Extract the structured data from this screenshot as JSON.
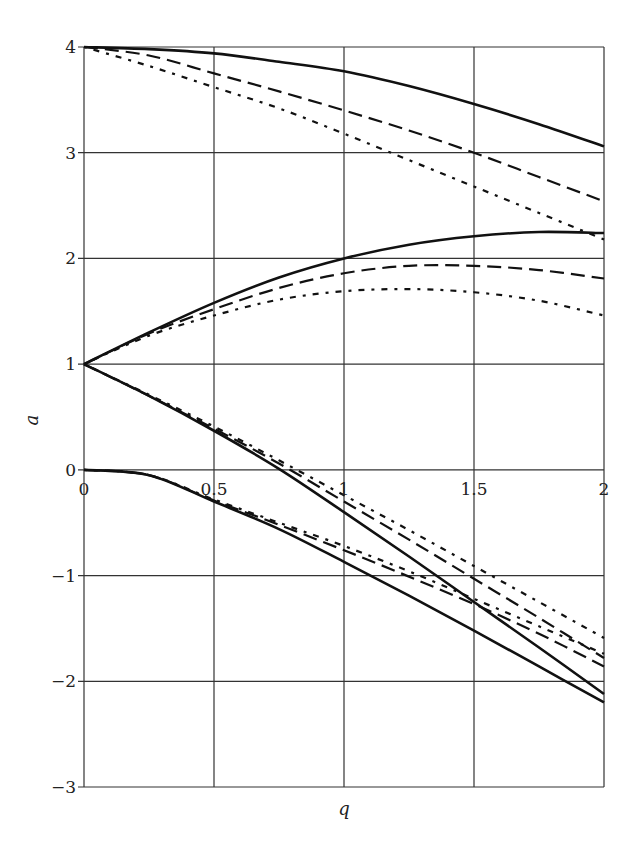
{
  "chart_data": {
    "type": "line",
    "title": "",
    "xlabel": "q",
    "ylabel": "a",
    "xlim": [
      0,
      2
    ],
    "ylim": [
      -3,
      4
    ],
    "grid": true,
    "legend": "none",
    "x_ticks": [
      0,
      0.5,
      1,
      1.5,
      2
    ],
    "x_tick_labels": [
      "0",
      "0.5",
      "1",
      "1.5",
      "2"
    ],
    "y_ticks": [
      4,
      3,
      2,
      1,
      0,
      -1,
      -2,
      -3
    ],
    "y_tick_labels": [
      "4",
      "3",
      "2",
      "1",
      "0",
      "−1",
      "−2",
      "−3"
    ],
    "x": [
      0,
      0.25,
      0.5,
      0.75,
      1.0,
      1.25,
      1.5,
      1.75,
      2.0
    ],
    "series": [
      {
        "name": "branch-4-solid",
        "style": "solid",
        "values": [
          4.0,
          3.98,
          3.94,
          3.86,
          3.77,
          3.63,
          3.46,
          3.27,
          3.06
        ]
      },
      {
        "name": "branch-4-dashed",
        "style": "dashed",
        "values": [
          4.0,
          3.92,
          3.75,
          3.58,
          3.4,
          3.21,
          3.0,
          2.77,
          2.54
        ]
      },
      {
        "name": "branch-4-dashdot",
        "style": "dashdot",
        "values": [
          4.0,
          3.82,
          3.62,
          3.42,
          3.18,
          2.93,
          2.68,
          2.43,
          2.18
        ]
      },
      {
        "name": "branch-1-upper-solid",
        "style": "solid",
        "values": [
          1.0,
          1.3,
          1.58,
          1.82,
          2.0,
          2.13,
          2.21,
          2.25,
          2.24
        ]
      },
      {
        "name": "branch-1-upper-dashed",
        "style": "dashed",
        "values": [
          1.0,
          1.29,
          1.52,
          1.72,
          1.86,
          1.93,
          1.93,
          1.89,
          1.81
        ]
      },
      {
        "name": "branch-1-upper-dashdot",
        "style": "dashdot",
        "values": [
          1.0,
          1.27,
          1.46,
          1.61,
          1.69,
          1.71,
          1.68,
          1.6,
          1.46
        ]
      },
      {
        "name": "branch-1-lower-solid",
        "style": "solid",
        "values": [
          1.0,
          0.7,
          0.37,
          0.01,
          -0.4,
          -0.82,
          -1.25,
          -1.68,
          -2.12
        ]
      },
      {
        "name": "branch-1-lower-dashed",
        "style": "dashed",
        "values": [
          1.0,
          0.7,
          0.39,
          0.06,
          -0.3,
          -0.66,
          -1.03,
          -1.4,
          -1.78
        ]
      },
      {
        "name": "branch-1-lower-dashdot",
        "style": "dashdot",
        "values": [
          1.0,
          0.71,
          0.41,
          0.09,
          -0.24,
          -0.57,
          -0.91,
          -1.25,
          -1.59
        ]
      },
      {
        "name": "branch-0-solid",
        "style": "solid",
        "values": [
          0.0,
          -0.05,
          -0.3,
          -0.56,
          -0.87,
          -1.19,
          -1.52,
          -1.86,
          -2.2
        ]
      },
      {
        "name": "branch-0-dashed",
        "style": "dashed",
        "values": [
          0.0,
          -0.05,
          -0.29,
          -0.52,
          -0.76,
          -1.01,
          -1.27,
          -1.55,
          -1.86
        ]
      },
      {
        "name": "branch-0-dashdot",
        "style": "dashdot",
        "values": [
          0.0,
          -0.05,
          -0.28,
          -0.5,
          -0.72,
          -0.96,
          -1.22,
          -1.48,
          -1.74
        ]
      }
    ]
  },
  "colors": {
    "line": "#111111",
    "grid": "#333333",
    "background": "#ffffff"
  }
}
